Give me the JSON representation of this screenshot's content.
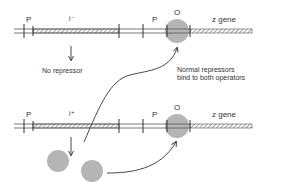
{
  "diagram": {
    "top_row": {
      "labels": {
        "promoter_left": "P",
        "i_gene": "i⁻",
        "promoter_right": "P",
        "operator": "O",
        "z_gene": "z gene"
      },
      "result_text": "No repressor"
    },
    "middle_caption": {
      "line1": "Normal repressors",
      "line2": "bind to both operators"
    },
    "bottom_row": {
      "labels": {
        "promoter_left": "P",
        "i_gene": "i⁺",
        "promoter_right": "P",
        "operator": "O",
        "z_gene": "z gene"
      }
    },
    "colors": {
      "repressor": "#b5b5b5",
      "line": "#333333",
      "hatch": "#555555"
    }
  }
}
